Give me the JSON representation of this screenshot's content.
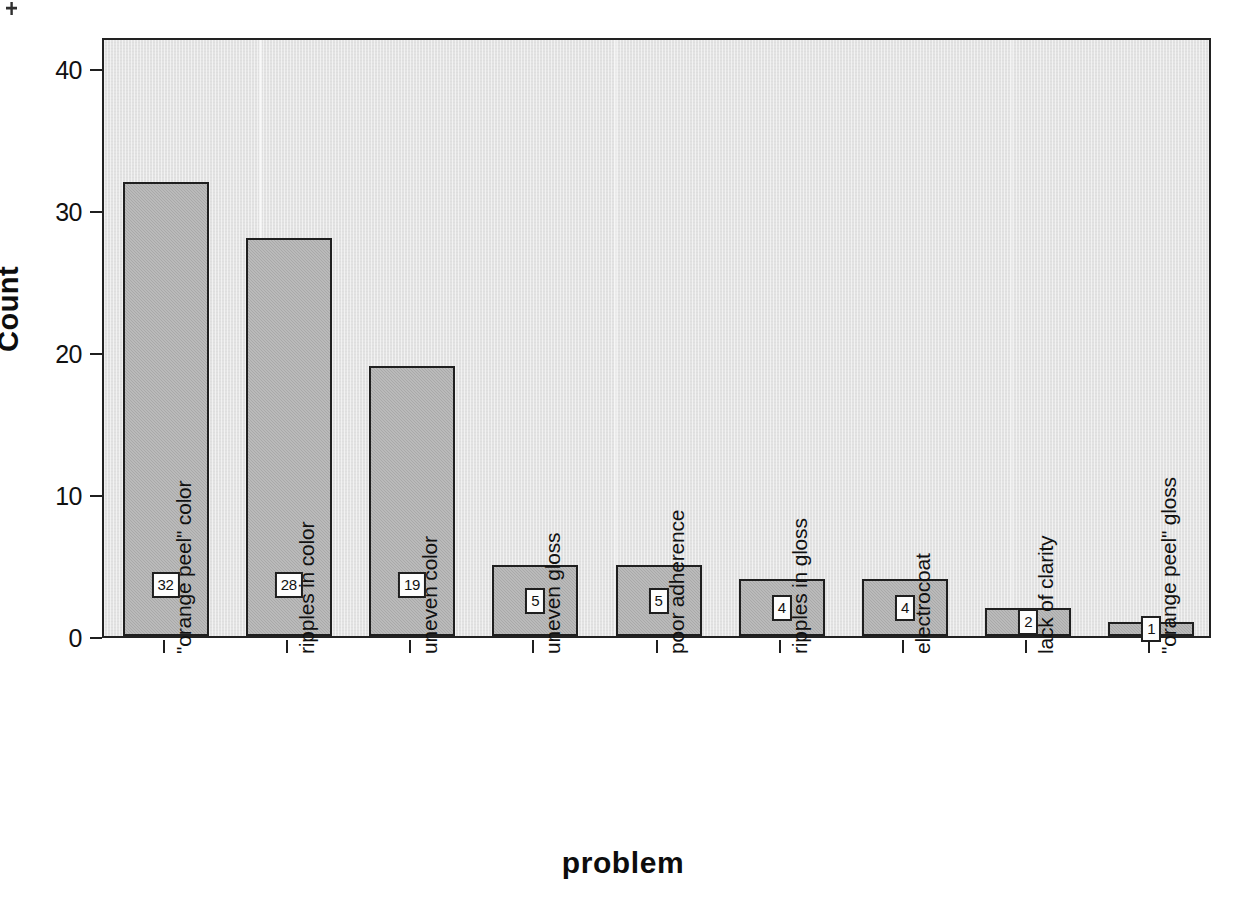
{
  "chart_data": {
    "type": "bar",
    "title": "",
    "xlabel": "problem",
    "ylabel": "Count",
    "categories": [
      "\"orange peel\" color",
      "ripples in color",
      "uneven color",
      "uneven gloss",
      "poor adherence",
      "ripples in gloss",
      "electrocoat",
      "lack of clarity",
      "\"orange peel\" gloss"
    ],
    "values": [
      32,
      28,
      19,
      5,
      5,
      4,
      4,
      2,
      1
    ],
    "data_labels": [
      "32",
      "28",
      "19",
      "5",
      "5",
      "4",
      "4",
      "2",
      "1"
    ],
    "ylim": [
      0,
      42
    ],
    "yticks": [
      0,
      10,
      20,
      30,
      40
    ],
    "ytick_labels": [
      "0",
      "10",
      "20",
      "30",
      "40"
    ],
    "grid": false,
    "legend": false,
    "bar_fill_color": "#a9a9a9",
    "bar_border_color": "#1f1f1f",
    "plot_background_color": "#e3e3e3",
    "page_background_color": "#ffffff",
    "axis_color": "#1f1f1f",
    "label_box_background": "#fdfdfd"
  },
  "axes": {
    "y_title": "Count",
    "x_title": "problem"
  }
}
